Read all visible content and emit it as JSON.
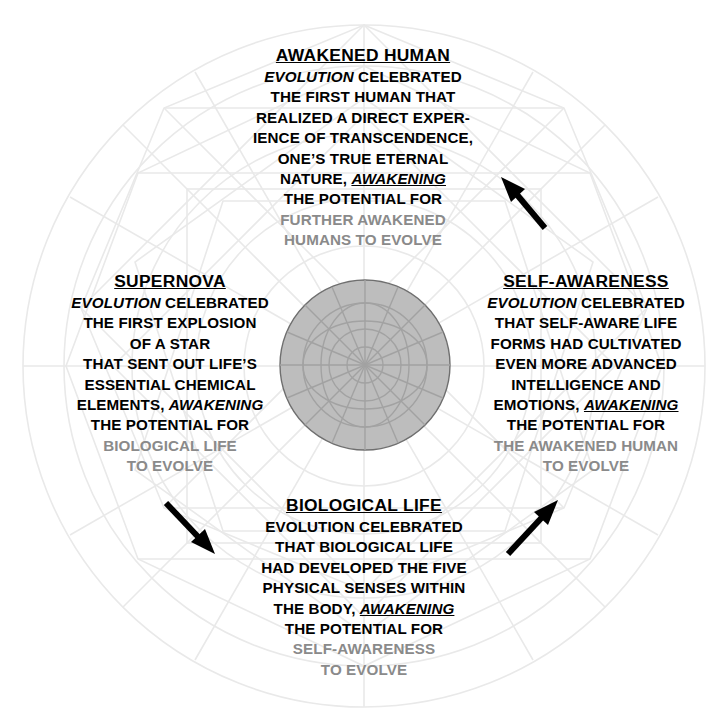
{
  "diagram": {
    "center_circle": {
      "fill_color": "#bdbdbd",
      "stroke_color": "#7a7a7a",
      "cx": 365,
      "cy": 365,
      "r": 85
    },
    "web_color": "#e8e8e8",
    "outer_circle": {
      "cx": 364,
      "cy": 366,
      "r": 341
    },
    "text_colors": {
      "primary": "#000000",
      "secondary": "#8a8a8a"
    }
  },
  "blocks": {
    "awakened_human": {
      "title": "AWAKENED HUMAN",
      "lines": [
        {
          "text": "EVOLUTION",
          "style": "italic",
          "trailing": " CELEBRATED",
          "gray": false
        },
        {
          "text": "THE FIRST HUMAN THAT",
          "gray": false
        },
        {
          "text": "REALIZED A DIRECT EXPER-",
          "gray": false
        },
        {
          "text": "IENCE OF TRANSCENDENCE,",
          "gray": false
        },
        {
          "text": "ONE’S TRUE ETERNAL",
          "gray": false
        },
        {
          "text": "NATURE, ",
          "emph": "AWAKENING",
          "emph_style": "italic-underline",
          "gray": false
        },
        {
          "text": "THE POTENTIAL FOR",
          "gray": false
        },
        {
          "text": "FURTHER AWAKENED",
          "gray": true
        },
        {
          "text": "HUMANS TO EVOLVE",
          "gray": true
        }
      ]
    },
    "supernova": {
      "title": "SUPERNOVA",
      "lines": [
        {
          "text": "EVOLUTION",
          "style": "italic",
          "trailing": " CELEBRATED",
          "gray": false
        },
        {
          "text": "THE FIRST EXPLOSION",
          "gray": false
        },
        {
          "text": "OF A STAR",
          "gray": false
        },
        {
          "text": "THAT SENT OUT LIFE’S",
          "gray": false
        },
        {
          "text": "ESSENTIAL CHEMICAL",
          "gray": false
        },
        {
          "text": "ELEMENTS, ",
          "emph": "AWAKENING",
          "emph_style": "italic",
          "gray": false
        },
        {
          "text": "THE POTENTIAL FOR",
          "gray": false
        },
        {
          "text": "BIOLOGICAL LIFE",
          "gray": true
        },
        {
          "text": "TO EVOLVE",
          "gray": true
        }
      ]
    },
    "self_awareness": {
      "title": "SELF-AWARENESS",
      "lines": [
        {
          "text": "EVOLUTION",
          "style": "italic",
          "trailing": " CELEBRATED",
          "gray": false
        },
        {
          "text": "THAT SELF-AWARE LIFE",
          "gray": false
        },
        {
          "text": "FORMS HAD CULTIVATED",
          "gray": false
        },
        {
          "text": "EVEN MORE ADVANCED",
          "gray": false
        },
        {
          "text": "INTELLIGENCE AND",
          "gray": false
        },
        {
          "text": "EMOTIONS, ",
          "emph": "AWAKENING",
          "emph_style": "italic-underline",
          "gray": false
        },
        {
          "text": "THE POTENTIAL FOR",
          "gray": false
        },
        {
          "text": "THE AWAKENED HUMAN",
          "gray": true
        },
        {
          "text": "TO EVOLVE",
          "gray": true
        }
      ]
    },
    "biological_life": {
      "title": "BIOLOGICAL LIFE",
      "lines": [
        {
          "text": "EVOLUTION CELEBRATED",
          "gray": false
        },
        {
          "text": "THAT BIOLOGICAL LIFE",
          "gray": false
        },
        {
          "text": "HAD DEVELOPED THE FIVE",
          "gray": false
        },
        {
          "text": "PHYSICAL SENSES WITHIN",
          "gray": false
        },
        {
          "text": "THE BODY, ",
          "emph": "AWAKENING",
          "emph_style": "italic-underline",
          "gray": false
        },
        {
          "text": "THE POTENTIAL FOR",
          "gray": false
        },
        {
          "text": "SELF-AWARENESS",
          "gray": true
        },
        {
          "text": "TO EVOLVE",
          "gray": true
        }
      ]
    }
  },
  "arrows": [
    {
      "name": "arrow-to-awakened-human",
      "direction": "up-left",
      "x": 498,
      "y": 170,
      "length": 62
    },
    {
      "name": "arrow-to-biological-life",
      "direction": "down-right",
      "x": 160,
      "y": 498,
      "length": 62
    },
    {
      "name": "arrow-to-self-awareness",
      "direction": "up-right",
      "x": 500,
      "y": 500,
      "length": 62
    }
  ]
}
